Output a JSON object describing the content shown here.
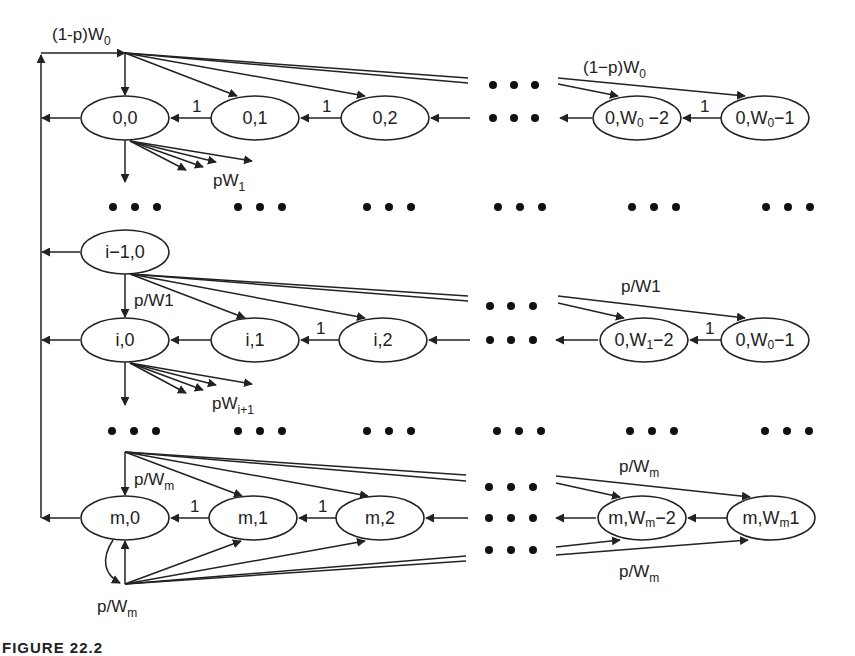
{
  "diagram": {
    "rows": [
      {
        "stage": "0",
        "nodes": [
          {
            "id": "0,0",
            "label": "0,0"
          },
          {
            "id": "0,1",
            "label": "0,1"
          },
          {
            "id": "0,2",
            "label": "0,2"
          },
          {
            "id": "0,W0-2",
            "label_main": "0,W",
            "label_sub": "0",
            "label_tail": " −2"
          },
          {
            "id": "0,W0-1",
            "label_main": "0,W",
            "label_sub": "0",
            "label_tail": "−1"
          }
        ],
        "labels": {
          "source_left": {
            "main": "(1-p)W",
            "sub": "0"
          },
          "source_right": {
            "main": "(1−p)W",
            "sub": "0"
          },
          "exit": {
            "main": "pW",
            "sub": "1"
          },
          "backward_weight": "1"
        }
      },
      {
        "stage": "i-1",
        "nodes": [
          {
            "id": "i-1,0",
            "label": "i−1,0"
          }
        ]
      },
      {
        "stage": "i",
        "nodes": [
          {
            "id": "i,0",
            "label": "i,0"
          },
          {
            "id": "i,1",
            "label": "i,1"
          },
          {
            "id": "i,2",
            "label": "i,2"
          },
          {
            "id": "0,W1-2",
            "label_main": "0,W",
            "label_sub": "1",
            "label_tail": "−2"
          },
          {
            "id": "0,W0-1b",
            "label_main": "0,W",
            "label_sub": "0",
            "label_tail": "−1"
          }
        ],
        "labels": {
          "source_left": "p/W1",
          "source_right": "p/W1",
          "exit": {
            "main": "pW",
            "sub": "i+1"
          },
          "backward_weight": "1"
        }
      },
      {
        "stage": "m",
        "nodes": [
          {
            "id": "m,0",
            "label": "m,0"
          },
          {
            "id": "m,1",
            "label": "m,1"
          },
          {
            "id": "m,2",
            "label": "m,2"
          },
          {
            "id": "m,Wm-2",
            "label_main": "m,W",
            "label_sub": "m",
            "label_tail": "−2"
          },
          {
            "id": "m,Wm1",
            "label_main": "m,W",
            "label_sub": "m",
            "label_tail": "1"
          }
        ],
        "labels": {
          "source_top_left": {
            "main": "p/W",
            "sub": "m"
          },
          "source_top_right": {
            "main": "p/W",
            "sub": "m"
          },
          "source_bottom_left": {
            "main": "p/W",
            "sub": "m"
          },
          "source_bottom_right": {
            "main": "p/W",
            "sub": "m"
          },
          "backward_weight": "1"
        }
      }
    ],
    "ellipsis": "•••"
  },
  "caption": "FIGURE 22.2"
}
